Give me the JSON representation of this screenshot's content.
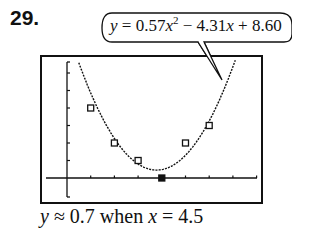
{
  "problem_number": "29.",
  "equation": {
    "y": "y",
    "eq": " = 0.57",
    "x1": "x",
    "sup": "2",
    "rest1": " − 4.31",
    "x2": "x",
    "rest2": " + 8.60"
  },
  "caption": {
    "y": "y",
    "mid": " ≈ 0.7 when ",
    "x": "x",
    "end": " = 4.5"
  },
  "chart_data": {
    "type": "scatter",
    "title": "",
    "xlabel": "",
    "ylabel": "",
    "regression": {
      "model": "quadratic",
      "a": 0.57,
      "b": -4.31,
      "c": 8.6,
      "label": "y = 0.57x^2 - 4.31x + 8.60"
    },
    "points": [
      {
        "x": 1,
        "y": 4
      },
      {
        "x": 2,
        "y": 2
      },
      {
        "x": 3,
        "y": 1
      },
      {
        "x": 4,
        "y": 0
      },
      {
        "x": 5,
        "y": 2
      },
      {
        "x": 6,
        "y": 3
      }
    ],
    "xlim": [
      -1,
      8
    ],
    "ylim": [
      -1,
      6
    ],
    "x_ticks": [
      1,
      2,
      3,
      4,
      5,
      6,
      7,
      8
    ],
    "y_ticks": [
      1,
      2,
      3,
      4,
      5,
      6
    ],
    "grid": false,
    "annotation": "y ≈ 0.7 when x = 4.5"
  }
}
